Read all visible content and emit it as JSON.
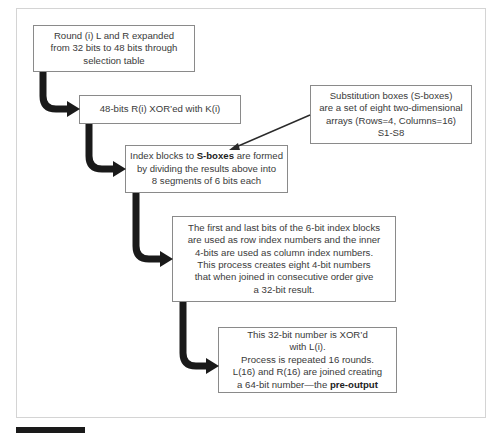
{
  "diagram": {
    "boxes": [
      {
        "id": "expansion",
        "lines": [
          "Round (i) L and R expanded",
          "from 32 bits to 48 bits through",
          "selection table"
        ]
      },
      {
        "id": "xor-key",
        "lines": [
          "48-bits R(i) XOR’ed with K(i)"
        ]
      },
      {
        "id": "sbox-definition",
        "lines": [
          "Substitution boxes (S-boxes)",
          "are a set of eight two-dimensional",
          "arrays (Rows=4, Columns=16)",
          "S1-S8"
        ]
      },
      {
        "id": "index-blocks",
        "line1_prefix": "Index blocks to ",
        "line1_bold": "S-boxes",
        "line1_suffix": " are formed",
        "lines": [
          "by dividing the results above into",
          "8 segments of 6 bits each"
        ]
      },
      {
        "id": "row-column-index",
        "lines": [
          "The first and last bits of the 6-bit index blocks",
          "are used as row index numbers and the inner",
          "4-bits are used as column index numbers.",
          "This process creates eight 4-bit numbers",
          "that when joined in consecutive order give",
          "a 32-bit result."
        ]
      },
      {
        "id": "pre-output",
        "lines": [
          "This 32-bit number is XOR’d",
          "with L(i).",
          "Process is repeated 16 rounds.",
          "L(16) and R(16) are joined creating"
        ],
        "last_prefix": "a 64-bit number—the ",
        "last_bold": "pre-output"
      }
    ],
    "connectors": [
      {
        "from": "expansion",
        "to": "xor-key",
        "style": "thick-curved-arrow"
      },
      {
        "from": "xor-key",
        "to": "index-blocks",
        "style": "thick-curved-arrow"
      },
      {
        "from": "index-blocks",
        "to": "row-column-index",
        "style": "thick-curved-arrow"
      },
      {
        "from": "row-column-index",
        "to": "pre-output",
        "style": "thick-curved-arrow"
      },
      {
        "from": "sbox-definition",
        "to": "index-blocks",
        "style": "thin-pointer-arrow"
      }
    ],
    "colors": {
      "arrow": "#1a1a1a",
      "box_border": "#8a8a8a",
      "frame_border": "#d4d4d4",
      "text": "#3a3a3a"
    }
  }
}
